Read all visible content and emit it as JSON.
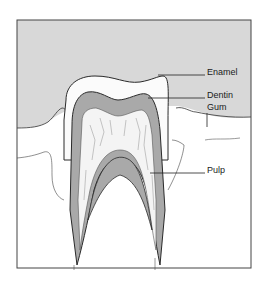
{
  "diagram": {
    "labels": {
      "enamel": "Enamel",
      "dentin": "Dentin",
      "gum": "Gum",
      "pulp": "Pulp"
    },
    "colors": {
      "background": "#ffffff",
      "mouth_area": "#d8d8d8",
      "enamel": "#fbfbfb",
      "dentin": "#a9a9a9",
      "pulp": "#f4f4f4",
      "outline": "#2a2a2a"
    }
  }
}
